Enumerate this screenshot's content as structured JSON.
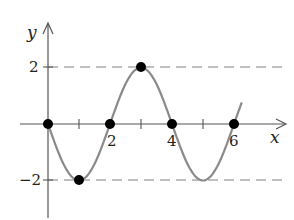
{
  "header": {
    "fragment": "31."
  },
  "chart_data": {
    "type": "line",
    "title": "",
    "xlabel": "x",
    "ylabel": "y",
    "function": "y = -2 sin(pi x / 2)",
    "x_ticks": [
      1,
      2,
      3,
      4,
      5,
      6
    ],
    "x_tick_labels": [
      "2",
      "4",
      "6"
    ],
    "y_tick_labels": [
      "2",
      "-2"
    ],
    "y_ticks": [
      2,
      -2
    ],
    "reference_lines": [
      {
        "y": 2,
        "style": "dashed"
      },
      {
        "y": -2,
        "style": "dashed"
      }
    ],
    "highlighted_points": [
      {
        "x": 0,
        "y": 0
      },
      {
        "x": 1,
        "y": -2
      },
      {
        "x": 2,
        "y": 0
      },
      {
        "x": 3,
        "y": 2
      },
      {
        "x": 4,
        "y": 0
      },
      {
        "x": 6,
        "y": 0
      }
    ],
    "xlim": [
      -1.5,
      7.5
    ],
    "ylim": [
      -3.3,
      3.5
    ],
    "grid": false,
    "colors": {
      "curve": "#8a8a8a",
      "axes": "#555555",
      "dashes": "#aaaaaa",
      "points": "#000000"
    }
  },
  "labels": {
    "x_axis": "x",
    "y_axis": "y",
    "tick_2x": "2",
    "tick_4x": "4",
    "tick_6x": "6",
    "tick_2y": "2",
    "tick_neg2y": "−2"
  }
}
